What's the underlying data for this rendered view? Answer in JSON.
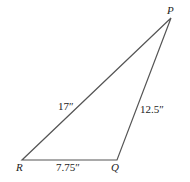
{
  "diagram": {
    "type": "triangle",
    "vertices": {
      "P": {
        "label": "P"
      },
      "Q": {
        "label": "Q"
      },
      "R": {
        "label": "R"
      }
    },
    "sides": {
      "PR": {
        "label": "17″"
      },
      "PQ": {
        "label": "12.5″"
      },
      "RQ": {
        "label": "7.75″"
      }
    },
    "stroke_color": "#555555"
  }
}
